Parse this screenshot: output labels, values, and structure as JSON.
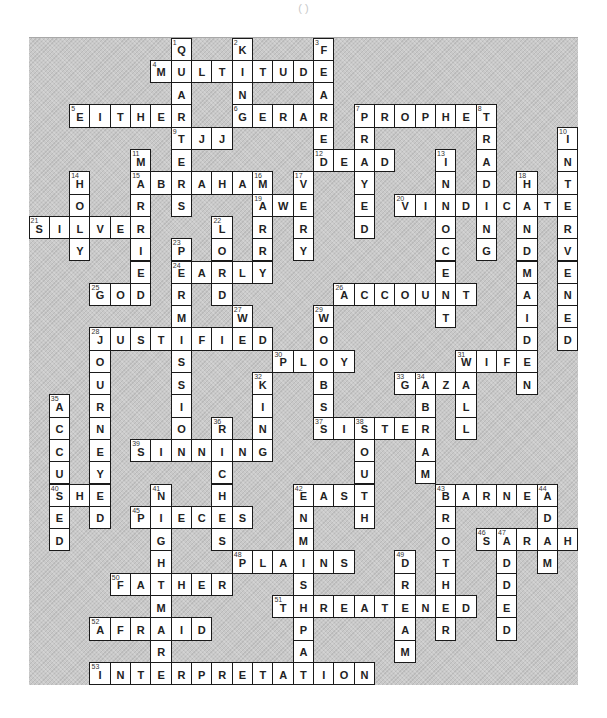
{
  "header": {
    "text": "(     )"
  },
  "board": {
    "cols": 27,
    "rows": 29,
    "background_color": "#c9c9c9",
    "cell_color": "#ffffff"
  },
  "across": [
    {
      "num": 4,
      "answer": "MULTITUDE",
      "row": 1,
      "col": 6
    },
    {
      "num": 5,
      "answer": "EITHER",
      "row": 3,
      "col": 2
    },
    {
      "num": 6,
      "answer": "GERAR",
      "row": 3,
      "col": 10
    },
    {
      "num": 7,
      "answer": "PROPHET",
      "row": 3,
      "col": 16
    },
    {
      "num": 9,
      "answer": "TJJ",
      "row": 4,
      "col": 7
    },
    {
      "num": 12,
      "answer": "DEAD",
      "row": 5,
      "col": 14
    },
    {
      "num": 15,
      "answer": "ABRAHAM",
      "row": 6,
      "col": 5
    },
    {
      "num": 19,
      "answer": "AWE",
      "row": 7,
      "col": 11
    },
    {
      "num": 20,
      "answer": "VINDICATE",
      "row": 7,
      "col": 18
    },
    {
      "num": 21,
      "answer": "SILVER",
      "row": 8,
      "col": 0
    },
    {
      "num": 24,
      "answer": "EARLY",
      "row": 10,
      "col": 7
    },
    {
      "num": 25,
      "answer": "GOD",
      "row": 11,
      "col": 3
    },
    {
      "num": 26,
      "answer": "ACCOUNT",
      "row": 11,
      "col": 15
    },
    {
      "num": 28,
      "answer": "JUSTIFIED",
      "row": 13,
      "col": 3
    },
    {
      "num": 30,
      "answer": "PLOY",
      "row": 14,
      "col": 12
    },
    {
      "num": 31,
      "answer": "WIFE",
      "row": 14,
      "col": 21
    },
    {
      "num": 33,
      "answer": "GAZA",
      "row": 15,
      "col": 18
    },
    {
      "num": 37,
      "answer": "SISTER",
      "row": 17,
      "col": 14
    },
    {
      "num": 39,
      "answer": "SINNING",
      "row": 18,
      "col": 5
    },
    {
      "num": 40,
      "answer": "SHE",
      "row": 20,
      "col": 1
    },
    {
      "num": 42,
      "answer": "EAST",
      "row": 20,
      "col": 13
    },
    {
      "num": 43,
      "answer": "BARNEA",
      "row": 20,
      "col": 20
    },
    {
      "num": 45,
      "answer": "PIECES",
      "row": 21,
      "col": 5
    },
    {
      "num": 46,
      "answer": "SARAH",
      "row": 22,
      "col": 22
    },
    {
      "num": 48,
      "answer": "PLAINS",
      "row": 23,
      "col": 10
    },
    {
      "num": 50,
      "answer": "FATHER",
      "row": 24,
      "col": 4
    },
    {
      "num": 51,
      "answer": "THREATENED",
      "row": 25,
      "col": 12
    },
    {
      "num": 52,
      "answer": "AFRAID",
      "row": 26,
      "col": 3
    },
    {
      "num": 53,
      "answer": "INTERPRETATION",
      "row": 28,
      "col": 3
    }
  ],
  "down": [
    {
      "num": 1,
      "answer": "QUARTERS",
      "row": 0,
      "col": 7
    },
    {
      "num": 2,
      "answer": "KING",
      "row": 0,
      "col": 10
    },
    {
      "num": 3,
      "answer": "FEARED",
      "row": 0,
      "col": 14
    },
    {
      "num": 7,
      "answer": "PRAYED",
      "row": 3,
      "col": 16
    },
    {
      "num": 8,
      "answer": "TRADING",
      "row": 3,
      "col": 22
    },
    {
      "num": 10,
      "answer": "INTERVENED",
      "row": 4,
      "col": 26
    },
    {
      "num": 11,
      "answer": "MARRIED",
      "row": 5,
      "col": 5
    },
    {
      "num": 13,
      "answer": "INNOCENT",
      "row": 5,
      "col": 20
    },
    {
      "num": 14,
      "answer": "HOLY",
      "row": 6,
      "col": 2
    },
    {
      "num": 16,
      "answer": "MARRY",
      "row": 6,
      "col": 11
    },
    {
      "num": 17,
      "answer": "VERY",
      "row": 6,
      "col": 13
    },
    {
      "num": 18,
      "answer": "HANDMAIDEN",
      "row": 6,
      "col": 24
    },
    {
      "num": 22,
      "answer": "LORD",
      "row": 8,
      "col": 9
    },
    {
      "num": 23,
      "answer": "PERMISSION",
      "row": 9,
      "col": 7
    },
    {
      "num": 27,
      "answer": "WE",
      "row": 12,
      "col": 10
    },
    {
      "num": 28,
      "answer": "JOURNEYED",
      "row": 13,
      "col": 3
    },
    {
      "num": 29,
      "answer": "WOMBS",
      "row": 12,
      "col": 14
    },
    {
      "num": 31,
      "answer": "WALL",
      "row": 14,
      "col": 21
    },
    {
      "num": 32,
      "answer": "KING",
      "row": 15,
      "col": 11
    },
    {
      "num": 34,
      "answer": "ABRAM",
      "row": 15,
      "col": 19
    },
    {
      "num": 35,
      "answer": "ACCUSED",
      "row": 16,
      "col": 1
    },
    {
      "num": 36,
      "answer": "RICHES",
      "row": 17,
      "col": 9
    },
    {
      "num": 38,
      "answer": "SOUTH",
      "row": 17,
      "col": 16
    },
    {
      "num": 41,
      "answer": "NIGHTMARE",
      "row": 20,
      "col": 6
    },
    {
      "num": 42,
      "answer": "ENMISHPAT",
      "row": 20,
      "col": 13
    },
    {
      "num": 43,
      "answer": "BROTHER",
      "row": 20,
      "col": 20
    },
    {
      "num": 44,
      "answer": "ADAM",
      "row": 20,
      "col": 25
    },
    {
      "num": 47,
      "answer": "ADDED",
      "row": 22,
      "col": 23
    },
    {
      "num": 49,
      "answer": "DREAM",
      "row": 23,
      "col": 18
    }
  ]
}
